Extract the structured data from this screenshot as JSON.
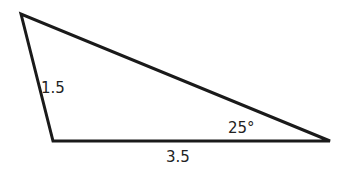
{
  "diagram": {
    "type": "triangle",
    "vertices": {
      "top_left": [
        21,
        14
      ],
      "bottom_left": [
        53,
        141
      ],
      "right": [
        330,
        141
      ]
    },
    "labels": {
      "side_left": "1.5",
      "side_bottom": "3.5",
      "angle_right": "25°"
    },
    "stroke_color": "#1a1a1a"
  }
}
